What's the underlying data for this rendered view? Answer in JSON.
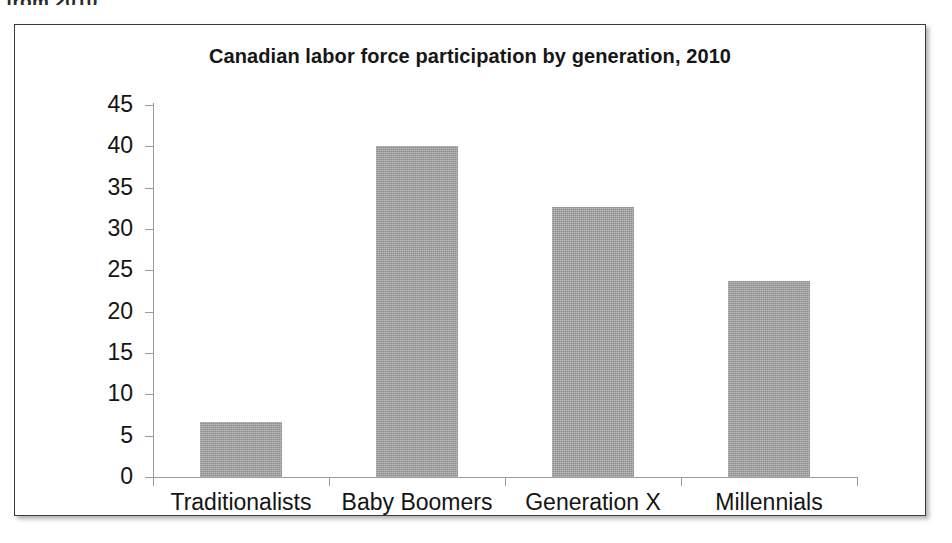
{
  "clipped_caption": "from 2010.",
  "figure": {
    "title": "Canadian labor force participation by generation, 2010"
  },
  "chart_data": {
    "type": "bar",
    "title": "Canadian labor force participation by generation, 2010",
    "xlabel": "",
    "ylabel": "",
    "categories": [
      "Traditionalists",
      "Baby Boomers",
      "Generation X",
      "Millennials"
    ],
    "values": [
      6.6,
      40.0,
      32.7,
      23.7
    ],
    "ylim": [
      0,
      45
    ],
    "ytick_labels": [
      "0",
      "5",
      "10",
      "15",
      "20",
      "25",
      "30",
      "35",
      "40",
      "45"
    ],
    "ytick_values": [
      0,
      5,
      10,
      15,
      20,
      25,
      30,
      35,
      40,
      45
    ],
    "grid": false,
    "legend": false,
    "bar_color": "#9b9b9b",
    "axis_color": "#9a9a9a",
    "text_color": "#141414",
    "background": "#ffffff"
  }
}
